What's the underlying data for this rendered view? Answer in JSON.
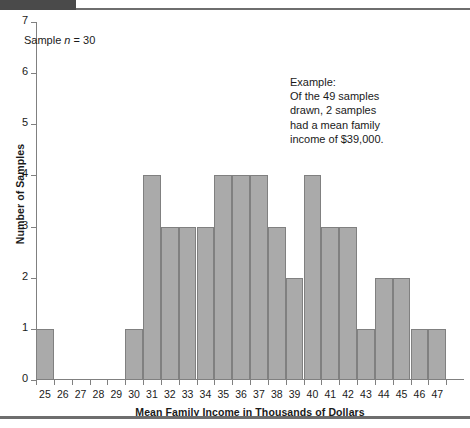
{
  "chart_data": {
    "type": "bar",
    "title": "",
    "subtitle": "",
    "xlabel": "Mean Family Income in Thousands of Dollars",
    "ylabel": "Number of Samples",
    "categories": [
      25,
      26,
      27,
      28,
      29,
      30,
      31,
      32,
      33,
      34,
      35,
      36,
      37,
      38,
      39,
      40,
      41,
      42,
      43,
      44,
      45,
      46,
      47
    ],
    "values": [
      1,
      0,
      0,
      0,
      0,
      1,
      4,
      3,
      3,
      3,
      4,
      4,
      4,
      3,
      2,
      4,
      3,
      3,
      1,
      2,
      2,
      1,
      1
    ],
    "xlim": [
      25,
      48
    ],
    "ylim": [
      0,
      7
    ],
    "ytick_labels": [
      "0",
      "1",
      "2",
      "3",
      "4",
      "5",
      "6",
      "7"
    ],
    "ytick_values": [
      0,
      1,
      2,
      3,
      4,
      5,
      6,
      7
    ],
    "xtick_labels": [
      "25",
      "26",
      "27",
      "28",
      "29",
      "30",
      "31",
      "32",
      "33",
      "34",
      "35",
      "36",
      "37",
      "38",
      "39",
      "40",
      "41",
      "42",
      "43",
      "44",
      "45",
      "46",
      "47"
    ],
    "grid": false,
    "legend": "none",
    "bar_fill_color": "#aaaaaa",
    "bar_border_color": "#808080",
    "axis_color": "#808080",
    "annotations": [
      {
        "name": "sample-size-note",
        "text": "Sample n = 30",
        "text_prefix": "Sample ",
        "text_italic": "n",
        "text_suffix": " = 30"
      },
      {
        "name": "example-callout",
        "text": "Example:\nOf the 49 samples\ndrawn, 2 samples\nhad a mean family\nincome of $39,000."
      }
    ]
  },
  "annotations": {
    "sample_note_prefix": "Sample ",
    "sample_note_italic": "n",
    "sample_note_suffix": " = 30",
    "example_text": "Example:\nOf the 49 samples\ndrawn, 2 samples\nhad a mean family\nincome of $39,000."
  },
  "axes": {
    "x_title": "Mean Family Income in Thousands of Dollars",
    "y_title": "Number of Samples"
  }
}
